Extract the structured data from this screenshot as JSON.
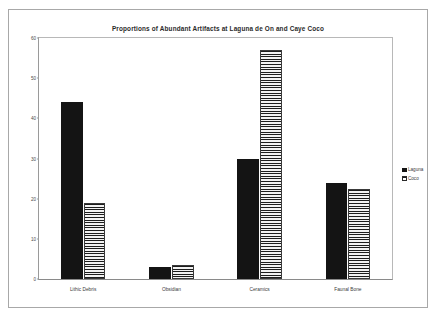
{
  "chart_data": {
    "type": "bar",
    "title": "Proportions of Abundant Artifacts at Laguna de On and Caye Coco",
    "xlabel": "",
    "ylabel": "",
    "ylim": [
      0,
      60
    ],
    "yticks": [
      0,
      10,
      20,
      30,
      40,
      50,
      60
    ],
    "ytick_labels": [
      "0",
      "10",
      "20",
      "30",
      "40",
      "50",
      "60"
    ],
    "grid": false,
    "legend_position": "right",
    "categories": [
      "Lithic Debris",
      "Obsidian",
      "Ceramics",
      "Faunal Bone"
    ],
    "series": [
      {
        "name": "Laguna",
        "pattern": "solid-black",
        "color": "#141414",
        "values": [
          44,
          3,
          30,
          24
        ]
      },
      {
        "name": "Coco",
        "pattern": "horizontal-stripes",
        "color": "#1d1d1d",
        "values": [
          19,
          3.5,
          57,
          22.5
        ]
      }
    ]
  },
  "legend": {
    "items": [
      {
        "label": "Laguna",
        "swatch": "solid-black-swatch"
      },
      {
        "label": "Coco",
        "swatch": "striped-swatch"
      }
    ]
  }
}
